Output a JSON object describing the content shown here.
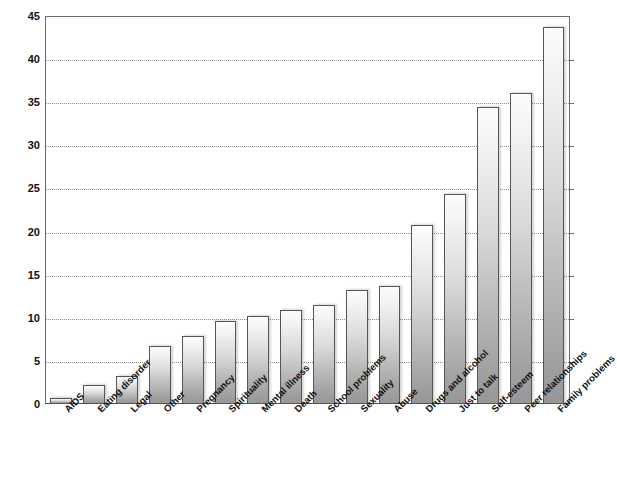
{
  "chart_data": {
    "type": "bar",
    "title": "",
    "xlabel": "",
    "ylabel": "Percentage of calls mentioning the concern",
    "ylim": [
      0,
      45
    ],
    "ytick_step": 5,
    "yticks": [
      0,
      5,
      10,
      15,
      20,
      25,
      30,
      35,
      40,
      45
    ],
    "grid": "horizontal-dotted",
    "legend": "none",
    "orientation": "vertical",
    "bar_style": {
      "fill": "vertical gray gradient (light top to mid-gray bottom)",
      "border_color": "#555555",
      "shadow": "true"
    },
    "categories": [
      "AIDS",
      "Eating disorder",
      "Legal",
      "Other",
      "Pregnancy",
      "Spirituality",
      "Mental illness",
      "Death",
      "School problems",
      "Sexuality",
      "Abuse",
      "Drugs and alcohol",
      "Just to talk",
      "Self-esteem",
      "Peer relationships",
      "Family problems"
    ],
    "values": [
      0.7,
      2.2,
      3.2,
      6.7,
      7.9,
      9.6,
      10.2,
      10.9,
      11.5,
      13.2,
      13.7,
      20.8,
      24.3,
      34.4,
      36.1,
      43.7
    ]
  },
  "axes": {
    "y_title": "Percentage of calls mentioning the concern",
    "y_tick_labels": [
      "0",
      "5",
      "10",
      "15",
      "20",
      "25",
      "30",
      "35",
      "40",
      "45"
    ]
  }
}
